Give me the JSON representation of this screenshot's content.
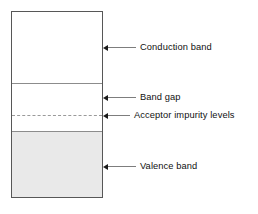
{
  "figure": {
    "background_color": "#ffffff"
  },
  "diagram": {
    "box": {
      "border_color": "#575757",
      "divider_color": "#8c8c8c"
    },
    "regions": [
      {
        "key": "conduction",
        "name": "Conduction band",
        "fill_color": "#ffffff",
        "fill_style": "empty"
      },
      {
        "key": "band_gap",
        "name": "Band gap",
        "fill_color": "#ffffff",
        "fill_style": "empty"
      },
      {
        "key": "valence",
        "name": "Valence band",
        "fill_color": "#e9e9e9",
        "fill_style": "filled"
      }
    ],
    "levels": [
      {
        "key": "acceptor",
        "name": "Acceptor impurity levels",
        "line_style": "dashed",
        "line_color": "#9a9a9a"
      }
    ]
  },
  "callouts": [
    {
      "key": "conduction",
      "label": "Conduction band",
      "arrow": "left-arrow-icon"
    },
    {
      "key": "band_gap",
      "label": "Band gap",
      "arrow": "left-arrow-icon"
    },
    {
      "key": "acceptor",
      "label": "Acceptor impurity levels",
      "arrow": "left-arrow-icon"
    },
    {
      "key": "valence",
      "label": "Valence band",
      "arrow": "left-arrow-icon"
    }
  ]
}
